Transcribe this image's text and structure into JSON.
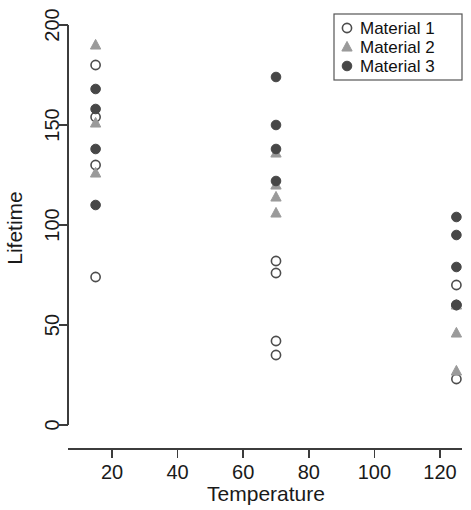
{
  "chart_data": {
    "type": "scatter",
    "title": "",
    "xlabel": "Temperature",
    "ylabel": "Lifetime",
    "xlim": [
      5,
      135
    ],
    "ylim": [
      0,
      205
    ],
    "xticks": [
      20,
      40,
      60,
      80,
      100,
      120
    ],
    "yticks": [
      0,
      50,
      100,
      150,
      200
    ],
    "grid": false,
    "legend_position": "top-right",
    "series": [
      {
        "name": "Material 1",
        "marker": "open-circle",
        "color": "#4d4d4d",
        "points": [
          {
            "x": 15,
            "y": 180
          },
          {
            "x": 15,
            "y": 154
          },
          {
            "x": 15,
            "y": 130
          },
          {
            "x": 15,
            "y": 74
          },
          {
            "x": 70,
            "y": 82
          },
          {
            "x": 70,
            "y": 76
          },
          {
            "x": 70,
            "y": 42
          },
          {
            "x": 70,
            "y": 35
          },
          {
            "x": 125,
            "y": 70
          },
          {
            "x": 125,
            "y": 60
          },
          {
            "x": 125,
            "y": 23
          }
        ]
      },
      {
        "name": "Material 2",
        "marker": "filled-triangle",
        "color": "#9a9a9a",
        "points": [
          {
            "x": 15,
            "y": 190
          },
          {
            "x": 15,
            "y": 151
          },
          {
            "x": 15,
            "y": 126
          },
          {
            "x": 70,
            "y": 136
          },
          {
            "x": 70,
            "y": 120
          },
          {
            "x": 70,
            "y": 114
          },
          {
            "x": 70,
            "y": 106
          },
          {
            "x": 125,
            "y": 60
          },
          {
            "x": 125,
            "y": 46
          },
          {
            "x": 125,
            "y": 27
          }
        ]
      },
      {
        "name": "Material 3",
        "marker": "filled-circle",
        "color": "#474747",
        "points": [
          {
            "x": 15,
            "y": 168
          },
          {
            "x": 15,
            "y": 158
          },
          {
            "x": 15,
            "y": 138
          },
          {
            "x": 15,
            "y": 110
          },
          {
            "x": 70,
            "y": 174
          },
          {
            "x": 70,
            "y": 150
          },
          {
            "x": 70,
            "y": 138
          },
          {
            "x": 70,
            "y": 122
          },
          {
            "x": 125,
            "y": 104
          },
          {
            "x": 125,
            "y": 95
          },
          {
            "x": 125,
            "y": 79
          },
          {
            "x": 125,
            "y": 60
          }
        ]
      }
    ],
    "legend": [
      {
        "label": "Material 1",
        "marker": "open-circle",
        "color": "#4d4d4d"
      },
      {
        "label": "Material 2",
        "marker": "filled-triangle",
        "color": "#9a9a9a"
      },
      {
        "label": "Material 3",
        "marker": "filled-circle",
        "color": "#474747"
      }
    ]
  }
}
